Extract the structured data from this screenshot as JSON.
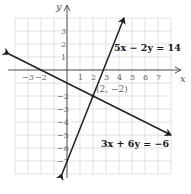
{
  "chart_data": {
    "type": "line",
    "title": "",
    "xlabel": "x",
    "ylabel": "y",
    "xlim": [
      -4,
      8
    ],
    "ylim": [
      -8,
      4
    ],
    "grid": true,
    "x_ticks": [
      "-3",
      "-2",
      "1",
      "2",
      "3",
      "4",
      "5",
      "6",
      "7"
    ],
    "y_ticks": [
      "3",
      "2",
      "1",
      "-2",
      "-3",
      "-4",
      "-5",
      "-6",
      "-7"
    ],
    "series": [
      {
        "name": "5x − 2y = 14",
        "equation": "5x - 2y = 14",
        "points": [
          [
            4.4,
            4
          ],
          [
            -0.4,
            -8
          ]
        ]
      },
      {
        "name": "3x + 6y = −6",
        "equation": "3x + 6y = -6",
        "points": [
          [
            -4.5,
            1.25
          ],
          [
            8,
            -5
          ]
        ]
      }
    ],
    "annotations": [
      {
        "text": "(2, −2)",
        "x": 2,
        "y": -2
      }
    ]
  },
  "labels": {
    "x_axis": "x",
    "y_axis": "y",
    "eq1": "5x − 2y = 14",
    "eq2": "3x + 6y = −6",
    "intersection": "(2, −2)"
  }
}
